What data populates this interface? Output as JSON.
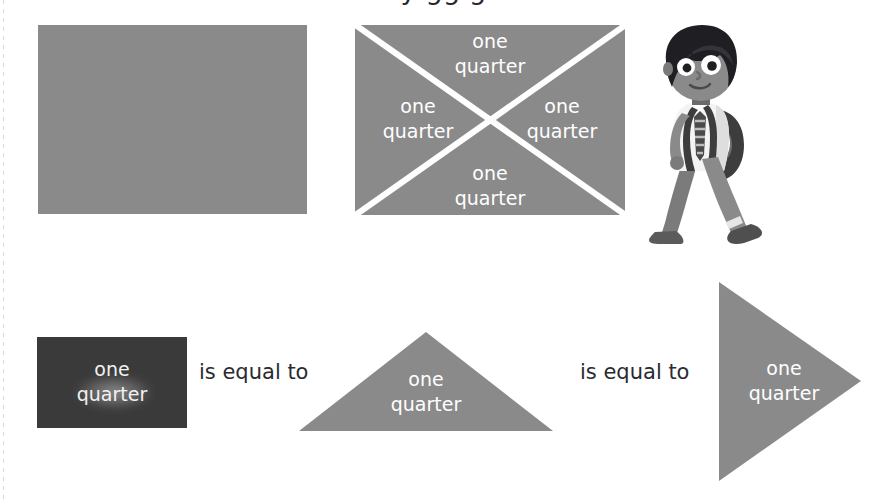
{
  "page": {
    "title_fragment": "y                    gg                  g",
    "background_color": "#ffffff",
    "width": 887,
    "height": 501
  },
  "colors": {
    "shape_gray": "#8a8a8a",
    "shape_dark": "#3a3a3a",
    "divider_white": "#ffffff",
    "label_white": "#ffffff",
    "body_text": "#2b2b2f",
    "margin_guide": "#cfcfcf"
  },
  "top_row": {
    "whole_rectangle": {
      "name": "whole-rectangle",
      "label": "",
      "fill": "#8a8a8a"
    },
    "quartered_rectangle": {
      "name": "quartered-rectangle",
      "fill": "#8a8a8a",
      "divider": "diagonal-cross",
      "sections": [
        {
          "position": "top",
          "label": "one\nquarter",
          "line1": "one",
          "line2": "quarter"
        },
        {
          "position": "left",
          "label": "one\nquarter",
          "line1": "one",
          "line2": "quarter"
        },
        {
          "position": "right",
          "label": "one\nquarter",
          "line1": "one",
          "line2": "quarter"
        },
        {
          "position": "bottom",
          "label": "one\nquarter",
          "line1": "one",
          "line2": "quarter"
        }
      ]
    },
    "character": {
      "name": "walking-schoolboy-illustration",
      "description": "cartoon boy walking with backpack, white shirt and striped tie"
    }
  },
  "bottom_row": {
    "dark_rectangle": {
      "name": "dark-quarter-rectangle",
      "line1": "one",
      "line2": "quarter",
      "fill": "#3a3a3a"
    },
    "equals_1": "is equal to",
    "triangle_up": {
      "name": "upward-quarter-triangle",
      "line1": "one",
      "line2": "quarter",
      "fill": "#8a8a8a"
    },
    "equals_2": "is equal to",
    "triangle_right": {
      "name": "rightward-quarter-triangle",
      "line1": "one",
      "line2": "quarter",
      "fill": "#8a8a8a"
    }
  }
}
